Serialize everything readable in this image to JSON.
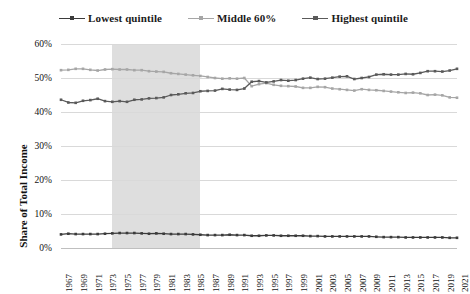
{
  "legend": {
    "position": "top-center",
    "items": [
      {
        "label": "Lowest quintile",
        "color": "#3b3b3b",
        "marker": "line-with-square-marker"
      },
      {
        "label": "Middle 60%",
        "color": "#a6a6a6",
        "marker": "line-with-square-marker"
      },
      {
        "label": "Highest quintile",
        "color": "#5a5a5a",
        "marker": "line-with-square-marker"
      }
    ]
  },
  "axes": {
    "ylabel": "Share of Total Income",
    "yticks": [
      "0%",
      "10%",
      "20%",
      "30%",
      "40%",
      "50%",
      "60%"
    ],
    "xlabel": ""
  },
  "annotations": {
    "shaded_band": {
      "start_year": 1974,
      "end_year": 1986,
      "color": "#dedede"
    }
  },
  "chart_data": {
    "type": "line",
    "title": "",
    "xlabel": "",
    "ylabel": "Share of Total Income",
    "ylim": [
      0,
      60
    ],
    "xlim": [
      1967,
      2021
    ],
    "grid": true,
    "legend_position": "top-center",
    "ytick_values": [
      0,
      10,
      20,
      30,
      40,
      50,
      60
    ],
    "ytick_labels": [
      "0%",
      "10%",
      "20%",
      "30%",
      "40%",
      "50%",
      "60%"
    ],
    "x": [
      1967,
      1968,
      1969,
      1970,
      1971,
      1972,
      1973,
      1974,
      1975,
      1976,
      1977,
      1978,
      1979,
      1980,
      1981,
      1982,
      1983,
      1984,
      1985,
      1986,
      1987,
      1988,
      1989,
      1990,
      1991,
      1992,
      1993,
      1994,
      1995,
      1996,
      1997,
      1998,
      1999,
      2000,
      2001,
      2002,
      2003,
      2004,
      2005,
      2006,
      2007,
      2008,
      2009,
      2010,
      2011,
      2012,
      2013,
      2014,
      2015,
      2016,
      2017,
      2018,
      2019,
      2020,
      2021
    ],
    "xtick_labels": [
      "1967",
      "1969",
      "1971",
      "1973",
      "1975",
      "1977",
      "1979",
      "1981",
      "1983",
      "1985",
      "1987",
      "1989",
      "1991",
      "1993",
      "1995",
      "1997",
      "1999",
      "2001",
      "2003",
      "2005",
      "2007",
      "2009",
      "2011",
      "2013",
      "2015",
      "2017",
      "2019",
      "2021"
    ],
    "series": [
      {
        "name": "Lowest quintile",
        "color": "#3b3b3b",
        "values": [
          4.0,
          4.2,
          4.1,
          4.1,
          4.1,
          4.1,
          4.2,
          4.3,
          4.4,
          4.4,
          4.4,
          4.3,
          4.2,
          4.3,
          4.2,
          4.1,
          4.1,
          4.1,
          4.0,
          3.9,
          3.8,
          3.8,
          3.8,
          3.9,
          3.8,
          3.8,
          3.6,
          3.6,
          3.7,
          3.7,
          3.6,
          3.6,
          3.6,
          3.6,
          3.5,
          3.5,
          3.4,
          3.4,
          3.4,
          3.4,
          3.4,
          3.4,
          3.4,
          3.3,
          3.2,
          3.2,
          3.2,
          3.1,
          3.1,
          3.1,
          3.1,
          3.1,
          3.1,
          3.0,
          3.0
        ]
      },
      {
        "name": "Middle 60%",
        "color": "#a6a6a6",
        "values": [
          52.3,
          52.4,
          52.7,
          52.7,
          52.4,
          52.2,
          52.5,
          52.6,
          52.5,
          52.5,
          52.3,
          52.3,
          52.0,
          51.9,
          51.8,
          51.4,
          51.2,
          51.0,
          50.8,
          50.6,
          50.3,
          50.0,
          49.8,
          49.9,
          49.8,
          50.0,
          47.6,
          48.2,
          48.5,
          48.0,
          47.7,
          47.6,
          47.5,
          47.1,
          47.1,
          47.4,
          47.3,
          46.9,
          46.7,
          46.5,
          46.3,
          46.7,
          46.5,
          46.4,
          46.2,
          46.0,
          45.8,
          45.6,
          45.7,
          45.5,
          45.0,
          45.1,
          44.9,
          44.3,
          44.2
        ]
      },
      {
        "name": "Highest quintile",
        "color": "#5a5a5a",
        "values": [
          43.6,
          42.8,
          42.7,
          43.3,
          43.5,
          43.9,
          43.2,
          43.0,
          43.2,
          43.0,
          43.6,
          43.7,
          44.0,
          44.1,
          44.3,
          45.0,
          45.2,
          45.5,
          45.6,
          46.1,
          46.2,
          46.3,
          46.8,
          46.6,
          46.5,
          46.9,
          48.9,
          49.1,
          48.7,
          49.0,
          49.4,
          49.2,
          49.4,
          49.8,
          50.1,
          49.7,
          49.8,
          50.1,
          50.4,
          50.5,
          49.7,
          50.0,
          50.3,
          51.0,
          51.1,
          51.0,
          51.0,
          51.2,
          51.1,
          51.5,
          52.0,
          52.0,
          51.9,
          52.2,
          52.7
        ]
      }
    ]
  }
}
